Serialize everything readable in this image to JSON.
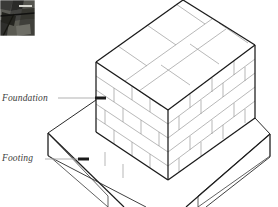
{
  "figure": {
    "type": "isometric-line-drawing",
    "background_color": "#ffffff",
    "line_color": "#000000",
    "mortar_line_color": "#9a9a9a",
    "leader_color": "#a8a8a8",
    "marker_color": "#1a1a1a",
    "text_color": "#3c3c3c"
  },
  "labels": [
    {
      "id": "foundation",
      "text": "Foundation",
      "text_x": 2,
      "text_y": 101,
      "leader_x1": 58,
      "leader_y1": 98,
      "leader_x2": 95,
      "leader_y2": 98,
      "marker_x1": 95,
      "marker_y1": 98,
      "marker_x2": 106,
      "marker_y2": 98
    },
    {
      "id": "footing",
      "text": "Footing",
      "text_x": 2,
      "text_y": 161,
      "leader_x1": 45,
      "leader_y1": 159,
      "leader_x2": 78,
      "leader_y2": 159,
      "marker_x1": 78,
      "marker_y1": 159,
      "marker_x2": 89,
      "marker_y2": 159
    }
  ],
  "photo_inset": {
    "name": "construction-photo-thumbnail",
    "x": 0,
    "y": 0,
    "width": 35,
    "height": 36,
    "description": "dark grayscale photograph of block wall construction",
    "base_color": "#4a4a48",
    "dark_color": "#1d1d1c",
    "mid_color": "#6b6b68",
    "light_color": "#c9c9c4"
  },
  "geometry": {
    "wall": {
      "top_left": [
        96,
        62
      ],
      "top_back": [
        183,
        0
      ],
      "top_right": [
        255,
        45
      ],
      "top_front": [
        168,
        110
      ],
      "bottom_left": [
        96,
        132
      ],
      "bottom_front": [
        168,
        180
      ],
      "bottom_right": [
        255,
        115
      ],
      "courses": 5,
      "course_height": 17
    },
    "footing": {
      "top_left": [
        48,
        133
      ],
      "top_back_left": [
        96,
        100
      ],
      "top_front": [
        168,
        196
      ],
      "top_right": [
        270,
        134
      ],
      "thickness": 22
    }
  }
}
